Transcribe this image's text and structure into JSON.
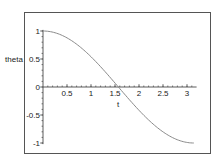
{
  "chart_data": {
    "type": "line",
    "title": "",
    "xlabel": "t",
    "ylabel": "theta",
    "xlim": [
      0,
      3.14159
    ],
    "ylim": [
      -1,
      1
    ],
    "grid": false,
    "legend": null,
    "x_ticks": [
      "0.5",
      "1",
      "1.5",
      "2",
      "2.5",
      "3"
    ],
    "y_ticks": [
      "1",
      "0.5",
      "0",
      "-0.5",
      "-1"
    ],
    "series": [
      {
        "name": "theta(t)",
        "x": [
          0,
          0.25,
          0.5,
          0.75,
          1.0,
          1.25,
          1.5,
          1.75,
          2.0,
          2.25,
          2.5,
          2.75,
          3.0,
          3.14159
        ],
        "y": [
          1.0,
          0.969,
          0.878,
          0.732,
          0.54,
          0.315,
          0.071,
          -0.178,
          -0.416,
          -0.628,
          -0.801,
          -0.924,
          -0.99,
          -1.0
        ]
      }
    ],
    "color": "#8a8a8a"
  }
}
